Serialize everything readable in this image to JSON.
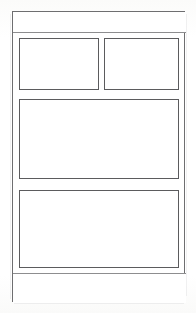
{
  "document": {
    "kind": "wireframe-layout-mockup",
    "canvas_width": 196,
    "canvas_height": 313
  },
  "colors": {
    "page_background": "#ffffff",
    "paper_background": "#fdfdfc",
    "frame_stroke": "#6e6e70",
    "box_stroke": "#5b5b5d",
    "divider_stroke": "#8d8d8f",
    "placeholder_text": "#9a9a9c"
  },
  "frame": {
    "name": "page-outline",
    "label": ""
  },
  "header": {
    "title": "",
    "name": "header-bar"
  },
  "content": {
    "boxes": [
      {
        "name": "box-top-left",
        "label": "",
        "region": "upper-left"
      },
      {
        "name": "box-top-right",
        "label": "",
        "region": "upper-right"
      },
      {
        "name": "box-main",
        "label": "",
        "region": "middle-full-width"
      },
      {
        "name": "box-secondary",
        "label": "",
        "region": "lower-full-width"
      }
    ]
  },
  "footer": {
    "text": "",
    "name": "footer-bar"
  }
}
